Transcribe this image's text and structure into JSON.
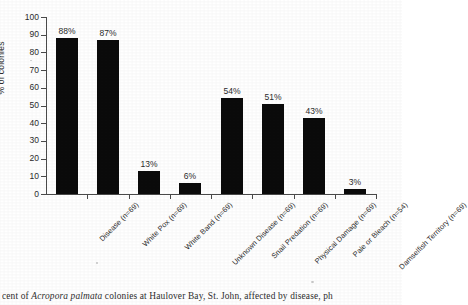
{
  "chart_data": {
    "type": "bar",
    "title": "",
    "xlabel": "",
    "ylabel": "% of colonies",
    "ylim": [
      0,
      100
    ],
    "ytick_step": 10,
    "yticks": [
      "100",
      "90",
      "80",
      "70",
      "60",
      "50",
      "40",
      "30",
      "20",
      "10",
      "0"
    ],
    "grid": false,
    "legend": "none",
    "bar_color": "#0b0b0b",
    "categories": [
      "Disease (n=69)",
      "White Pox (n=69)",
      "White Band (n=69)",
      "Unknown Disease (n=69)",
      "Snail Predation (n=69)",
      "Physical Damage (n=69)",
      "Pale or Bleach (n=54)",
      "Damselfish Territory (n=69)"
    ],
    "values": [
      88,
      87,
      13,
      6,
      54,
      51,
      43,
      3
    ],
    "data_labels": [
      "88%",
      "87%",
      "13%",
      "6%",
      "54%",
      "51%",
      "43%",
      "3%"
    ]
  },
  "caption": {
    "prefix": "cent of ",
    "species": "Acropora palmata",
    "suffix": " colonies at Haulover Bay, St. John, affected by disease, ph"
  }
}
